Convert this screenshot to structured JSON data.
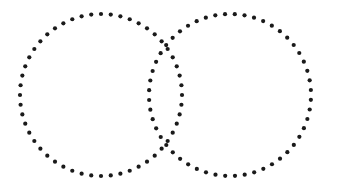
{
  "document": {
    "title": "Dotted Venn Circles",
    "width": 343,
    "height": 188,
    "background_color": "#ffffff"
  },
  "figure": {
    "name": "two-overlapping-dotted-circles",
    "style": {
      "dot_color": "#1a1a1a",
      "dot_radius": 2.1,
      "dot_count_per_circle": 52,
      "stroke_style": "dotted",
      "fill": "none"
    },
    "shapes": [
      {
        "name": "left-circle",
        "label": "Left circle",
        "cx": 101,
        "cy": 95,
        "r": 81,
        "dots": 52,
        "phase_deg": 0
      },
      {
        "name": "right-circle",
        "label": "Right circle",
        "cx": 230,
        "cy": 95,
        "r": 81,
        "dots": 52,
        "phase_deg": 3.4
      }
    ],
    "intersections": [
      {
        "name": "upper-intersection",
        "x": 172,
        "y": 53
      },
      {
        "name": "lower-intersection",
        "x": 172,
        "y": 138
      }
    ],
    "geometry_notes": {
      "center_distance": 129,
      "overlap_width": 33,
      "lens_height": 85
    }
  }
}
